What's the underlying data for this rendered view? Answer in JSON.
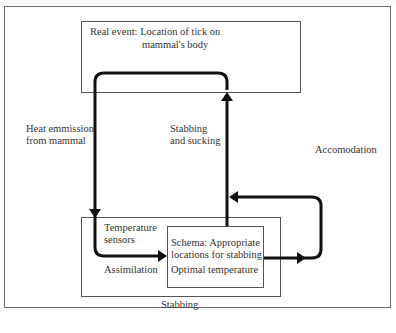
{
  "diagram": {
    "type": "flow-loop",
    "boxes": {
      "real_event": {
        "line1": "Real event: Location of tick on",
        "line2": "mammal's body"
      },
      "stabbing_outer": {
        "caption": "Stabbing",
        "sensors_line1": "Temperature",
        "sensors_line2": "sensors"
      },
      "schema": {
        "line1": "Schema: Appropriate",
        "line2": "locations for stabbing",
        "line3": "Optimal temperature"
      }
    },
    "arrows": {
      "heat_line1": "Heat emmission",
      "heat_line2": "from mammal",
      "stab_line1": "Stabbing",
      "stab_line2": "and sucking",
      "accommodation": "Accomodation",
      "assimilation": "Assimilation"
    },
    "colors": {
      "stroke": "#111111",
      "box_border": "#555555",
      "frame_border": "#6e6e6e",
      "text": "#333333"
    }
  }
}
